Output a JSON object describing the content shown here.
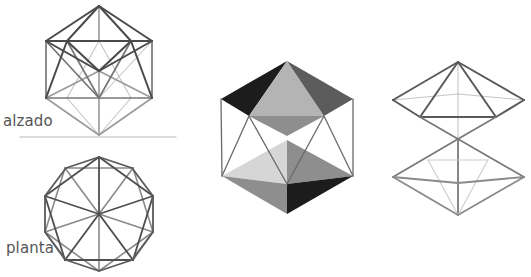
{
  "labels": {
    "elevation": "alzado",
    "plan": "planta"
  },
  "colors": {
    "edge_dark": "#4a4a4a",
    "edge_mid": "#777777",
    "edge_light": "#9a9a9a",
    "edge_faint": "#c4c4c4",
    "ground_line": "#b8b8b8",
    "face_black": "#1c1c1c",
    "face_dark": "#5c5c5c",
    "face_mid": "#8e8e8e",
    "face_light": "#b4b4b4",
    "face_pale": "#d6d6d6"
  },
  "figures": [
    {
      "name": "icosahedron-elevation",
      "view": "alzado"
    },
    {
      "name": "icosahedron-plan",
      "view": "planta"
    },
    {
      "name": "icosahedron-shaded-solid"
    },
    {
      "name": "icosahedron-exploded-pyramids"
    }
  ]
}
